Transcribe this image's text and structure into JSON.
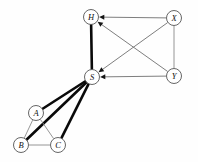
{
  "figure": {
    "name": "directed-graph-diagram",
    "background_color": "#fefefe",
    "width": 198,
    "height": 162
  },
  "style": {
    "node_fill": "#ffffff",
    "node_stroke": "#555555",
    "label_color": "#101010",
    "thin_edge_color": "#8a8a8a",
    "thick_edge_color": "#0a0a0a",
    "arrow_edge_color": "#6f6f6f",
    "arrowhead_color": "#151515",
    "node_radius": 7.5,
    "thin_width": 0.9,
    "thick_width": 2.6
  },
  "nodes": [
    {
      "id": "H",
      "label": "H",
      "x": 91,
      "y": 17
    },
    {
      "id": "X",
      "label": "X",
      "x": 174,
      "y": 18
    },
    {
      "id": "S",
      "label": "S",
      "x": 92,
      "y": 77
    },
    {
      "id": "Y",
      "label": "Y",
      "x": 174,
      "y": 76
    },
    {
      "id": "A",
      "label": "A",
      "x": 36,
      "y": 113
    },
    {
      "id": "B",
      "label": "B",
      "x": 21,
      "y": 145
    },
    {
      "id": "C",
      "label": "C",
      "x": 58,
      "y": 145
    }
  ],
  "edges": [
    {
      "from": "X",
      "to": "H",
      "style": "thin",
      "directed": true
    },
    {
      "from": "X",
      "to": "S",
      "style": "thin",
      "directed": true
    },
    {
      "from": "Y",
      "to": "H",
      "style": "thin",
      "directed": true
    },
    {
      "from": "Y",
      "to": "S",
      "style": "thin",
      "directed": true
    },
    {
      "from": "X",
      "to": "Y",
      "style": "thin",
      "directed": false
    },
    {
      "from": "H",
      "to": "S",
      "style": "thick",
      "directed": false
    },
    {
      "from": "S",
      "to": "A",
      "style": "thick",
      "directed": false
    },
    {
      "from": "S",
      "to": "B",
      "style": "thick",
      "directed": false
    },
    {
      "from": "S",
      "to": "C",
      "style": "thick",
      "directed": false
    },
    {
      "from": "A",
      "to": "B",
      "style": "thin",
      "directed": false
    },
    {
      "from": "A",
      "to": "C",
      "style": "thin",
      "directed": false
    },
    {
      "from": "B",
      "to": "C",
      "style": "thin",
      "directed": false
    }
  ]
}
